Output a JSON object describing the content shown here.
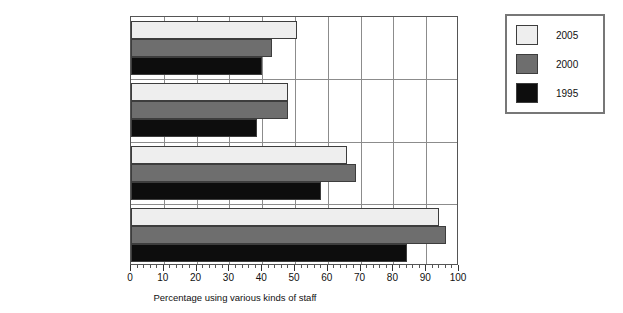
{
  "chart_data": {
    "type": "bar",
    "orientation": "horizontal",
    "title": "",
    "xlabel": "Percentage using various kinds of staff",
    "ylabel": "",
    "xlim": [
      0,
      100
    ],
    "xticks": [
      0,
      10,
      20,
      30,
      40,
      50,
      60,
      70,
      80,
      90,
      100
    ],
    "xtick_labels": [
      "0",
      "10",
      "20",
      "30",
      "40",
      "50",
      "60",
      "70",
      "80",
      "90",
      "100"
    ],
    "minor_tick_interval": 2,
    "grid": true,
    "grid_axis": "x",
    "legend_position": "right-outside",
    "categories": [
      "Full-time faculty",
      "Part-time faculty",
      "Paraprofessionals",
      "Students"
    ],
    "series": [
      {
        "name": "2005",
        "color": "#eeeeee",
        "values": [
          50.5,
          48.0,
          66.0,
          94.0
        ]
      },
      {
        "name": "2000",
        "color": "#6e6e6e",
        "values": [
          43.0,
          48.0,
          68.5,
          96.0
        ]
      },
      {
        "name": "1995",
        "color": "#0d0d0d",
        "values": [
          40.0,
          38.5,
          58.0,
          84.0
        ]
      }
    ]
  },
  "legend": {
    "entries": [
      {
        "label": "2005",
        "color": "#eeeeee"
      },
      {
        "label": "2000",
        "color": "#6e6e6e"
      },
      {
        "label": "1995",
        "color": "#0d0d0d"
      }
    ]
  },
  "axis": {
    "x_axis_title": "Percentage using various kinds of staff",
    "category_labels": [
      "Full-time faculty",
      "Part-time faculty",
      "Paraprofessionals",
      "Students"
    ]
  },
  "colors": {
    "series_2005": "#eeeeee",
    "series_2000": "#6e6e6e",
    "series_1995": "#0d0d0d",
    "axis_line": "#555555",
    "gridline": "#8c8c8c",
    "text": "#111111",
    "background": "#ffffff"
  }
}
